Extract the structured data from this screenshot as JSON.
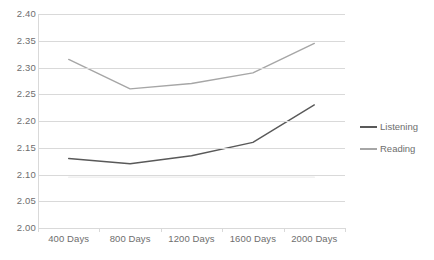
{
  "chart_data": {
    "type": "line",
    "title": "",
    "xlabel": "",
    "ylabel": "",
    "categories": [
      "400 Days",
      "800 Days",
      "1200 Days",
      "1600 Days",
      "2000 Days"
    ],
    "series": [
      {
        "name": "Listening",
        "color": "#595959",
        "values": [
          2.13,
          2.12,
          2.135,
          2.16,
          2.23
        ]
      },
      {
        "name": "Reading",
        "color": "#a6a6a6",
        "values": [
          2.315,
          2.26,
          2.27,
          2.29,
          2.345
        ]
      },
      {
        "name": "",
        "color": "#ededed",
        "values": [
          2.095,
          2.095,
          2.095,
          2.095,
          2.095
        ]
      }
    ],
    "ylim": [
      2.0,
      2.4
    ],
    "ystep": 0.05,
    "ytick_labels": [
      "2.40",
      "2.35",
      "2.30",
      "2.25",
      "2.20",
      "2.15",
      "2.10",
      "2.05",
      "2.00"
    ],
    "grid": true,
    "legend_position": "right"
  },
  "legend": {
    "items": [
      {
        "label": "Listening",
        "color": "#595959"
      },
      {
        "label": "Reading",
        "color": "#a6a6a6"
      }
    ]
  },
  "colors": {
    "gridline": "#d9d9d9",
    "axis": "#bfbfbf",
    "text": "#6e6e6e",
    "background": "#ffffff"
  }
}
